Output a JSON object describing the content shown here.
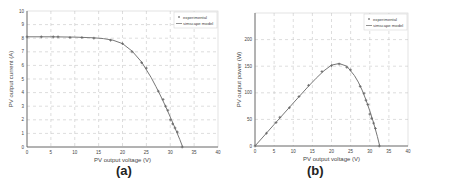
{
  "chart_data": [
    {
      "id": "a",
      "type": "line",
      "title": "",
      "caption": "(a)",
      "xlabel": "PV output voltage (V)",
      "ylabel": "PV output current (A)",
      "xlim": [
        0,
        40
      ],
      "ylim": [
        0,
        10
      ],
      "xticks": [
        0,
        5,
        10,
        15,
        20,
        25,
        30,
        35,
        40
      ],
      "yticks": [
        0,
        1,
        2,
        3,
        4,
        5,
        6,
        7,
        8,
        9,
        10
      ],
      "grid": true,
      "legend": {
        "position": "upper right",
        "entries": [
          "experimental",
          "simscape model"
        ]
      },
      "series": [
        {
          "name": "experimental",
          "style": "markers",
          "x": [
            0,
            3,
            5.5,
            6.5,
            9,
            11.5,
            14,
            17.5,
            20,
            22,
            24,
            25,
            27.5,
            28.5,
            29,
            29.5,
            30,
            30.5,
            31,
            31.5,
            32.5
          ],
          "y": [
            8.1,
            8.1,
            8.1,
            8.1,
            8.05,
            8.05,
            8.0,
            7.85,
            7.6,
            7.0,
            6.2,
            5.8,
            4.1,
            3.5,
            3.0,
            2.7,
            2.0,
            1.7,
            1.4,
            1.1,
            0.0
          ]
        },
        {
          "name": "simscape model",
          "style": "line",
          "x": [
            0,
            5,
            10,
            14,
            16,
            18,
            20,
            22,
            24,
            26,
            27,
            28,
            29,
            30,
            31,
            32,
            32.6
          ],
          "y": [
            8.1,
            8.1,
            8.08,
            8.03,
            7.97,
            7.85,
            7.6,
            7.05,
            6.25,
            5.1,
            4.45,
            3.75,
            3.0,
            2.2,
            1.4,
            0.55,
            0.0
          ]
        }
      ]
    },
    {
      "id": "b",
      "type": "line",
      "title": "",
      "caption": "(b)",
      "xlabel": "PV output voltage (V)",
      "ylabel": "PV output power (W)",
      "xlim": [
        0,
        40
      ],
      "ylim": [
        0,
        250
      ],
      "xticks": [
        0,
        5,
        10,
        15,
        20,
        25,
        30,
        35,
        40
      ],
      "yticks": [
        0,
        50,
        100,
        150,
        200
      ],
      "grid": true,
      "legend": {
        "position": "upper right",
        "entries": [
          "experimental",
          "simscape model"
        ]
      },
      "series": [
        {
          "name": "experimental",
          "style": "markers",
          "x": [
            0,
            3,
            5.5,
            6.5,
            9,
            11.5,
            14,
            17.5,
            20,
            22,
            24,
            25,
            27.5,
            28.5,
            29,
            29.5,
            30,
            30.5,
            31,
            31.5,
            32.5
          ],
          "y": [
            0,
            24,
            44,
            54,
            72,
            93,
            114,
            140,
            151,
            154,
            148,
            143,
            112,
            99,
            86,
            78,
            60,
            52,
            43,
            33,
            0
          ]
        },
        {
          "name": "simscape model",
          "style": "line",
          "x": [
            0,
            5,
            10,
            14,
            16,
            18,
            20,
            22,
            24,
            26,
            27,
            28,
            29,
            30,
            31,
            32,
            32.6
          ],
          "y": [
            0,
            40.5,
            80.8,
            112.4,
            127.5,
            141.3,
            152,
            155.1,
            150,
            132.6,
            120.2,
            105,
            87,
            66,
            43.4,
            17.6,
            0
          ]
        }
      ]
    }
  ],
  "captions": {
    "a": "(a)",
    "b": "(b)"
  },
  "colors": {
    "axis": "#555555",
    "grid": "#bbbbbb",
    "line": "#777777",
    "marker": "#666666",
    "text": "#444444"
  }
}
